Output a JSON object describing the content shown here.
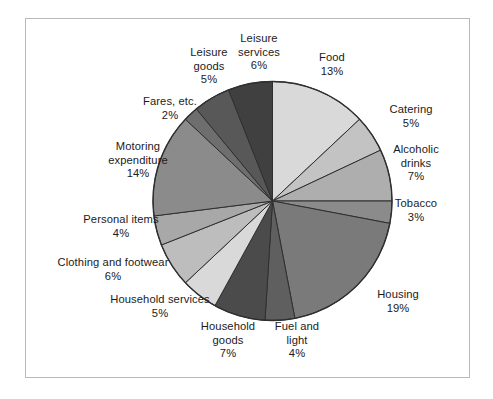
{
  "chart_data": {
    "type": "pie",
    "title": "",
    "subtitle": "",
    "xlabel": "",
    "ylabel": "",
    "legend_position": "none",
    "grid": false,
    "start_angle_deg": 0,
    "direction": "clockwise",
    "unit": "%",
    "categories": [
      "Food",
      "Catering",
      "Alcoholic drinks",
      "Tobacco",
      "Housing",
      "Fuel and light",
      "Household goods",
      "Household services",
      "Clothing and footwear",
      "Personal items",
      "Motoring expenditure",
      "Fares, etc.",
      "Leisure goods",
      "Leisure services"
    ],
    "values": [
      13,
      5,
      7,
      3,
      19,
      4,
      7,
      5,
      6,
      4,
      14,
      2,
      5,
      6
    ],
    "colors": [
      "#d9d9d9",
      "#c3c3c3",
      "#aeaeae",
      "#8b8b8b",
      "#7a7a7a",
      "#5f5f5f",
      "#4b4b4b",
      "#d9d9d9",
      "#bdbdbd",
      "#a8a8a8",
      "#8b8b8b",
      "#6e6e6e",
      "#585858",
      "#404040"
    ],
    "slices": [
      {
        "label": "Food",
        "value_text": "13%",
        "value": 13,
        "color": "#d9d9d9"
      },
      {
        "label": "Catering",
        "value_text": "5%",
        "value": 5,
        "color": "#c3c3c3"
      },
      {
        "label": "Alcoholic\ndrinks",
        "value_text": "7%",
        "value": 7,
        "color": "#aeaeae"
      },
      {
        "label": "Tobacco",
        "value_text": "3%",
        "value": 3,
        "color": "#8b8b8b"
      },
      {
        "label": "Housing",
        "value_text": "19%",
        "value": 19,
        "color": "#7a7a7a"
      },
      {
        "label": "Fuel and\nlight",
        "value_text": "4%",
        "value": 4,
        "color": "#5f5f5f"
      },
      {
        "label": "Household\ngoods",
        "value_text": "7%",
        "value": 7,
        "color": "#4b4b4b"
      },
      {
        "label": "Household services",
        "value_text": "5%",
        "value": 5,
        "color": "#d9d9d9"
      },
      {
        "label": "Clothing and footwear",
        "value_text": "6%",
        "value": 6,
        "color": "#bdbdbd"
      },
      {
        "label": "Personal items",
        "value_text": "4%",
        "value": 4,
        "color": "#a8a8a8"
      },
      {
        "label": "Motoring\nexpenditure",
        "value_text": "14%",
        "value": 14,
        "color": "#8b8b8b"
      },
      {
        "label": "Fares, etc.",
        "value_text": "2%",
        "value": 2,
        "color": "#6e6e6e"
      },
      {
        "label": "Leisure\ngoods",
        "value_text": "5%",
        "value": 5,
        "color": "#585858"
      },
      {
        "label": "Leisure\nservices",
        "value_text": "6%",
        "value": 6,
        "color": "#404040"
      }
    ]
  },
  "labels": {
    "food": {
      "line1": "Food",
      "line2": "",
      "value": "13%"
    },
    "catering": {
      "line1": "Catering",
      "line2": "",
      "value": "5%"
    },
    "alcoholic_drinks": {
      "line1": "Alcoholic",
      "line2": "drinks",
      "value": "7%"
    },
    "tobacco": {
      "line1": "Tobacco",
      "line2": "",
      "value": "3%"
    },
    "housing": {
      "line1": "Housing",
      "line2": "",
      "value": "19%"
    },
    "fuel_and_light": {
      "line1": "Fuel and",
      "line2": "light",
      "value": "4%"
    },
    "household_goods": {
      "line1": "Household",
      "line2": "goods",
      "value": "7%"
    },
    "household_services": {
      "line1": "Household services",
      "line2": "",
      "value": "5%"
    },
    "clothing": {
      "line1": "Clothing and footwear",
      "line2": "",
      "value": "6%"
    },
    "personal_items": {
      "line1": "Personal items",
      "line2": "",
      "value": "4%"
    },
    "motoring": {
      "line1": "Motoring",
      "line2": "expenditure",
      "value": "14%"
    },
    "fares": {
      "line1": "Fares, etc.",
      "line2": "",
      "value": "2%"
    },
    "leisure_goods": {
      "line1": "Leisure",
      "line2": "goods",
      "value": "5%"
    },
    "leisure_services": {
      "line1": "Leisure",
      "line2": "services",
      "value": "6%"
    }
  },
  "figure": {
    "border_color": "#b9b9b9",
    "background": "#ffffff",
    "stroke_color": "#2f2f2f"
  }
}
